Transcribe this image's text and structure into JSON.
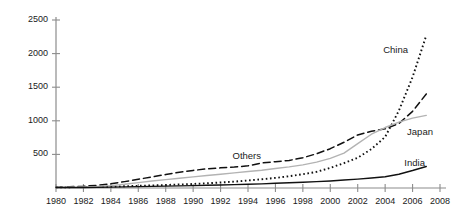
{
  "chart_data": {
    "type": "line",
    "title": "",
    "xlabel": "",
    "ylabel": "",
    "xlim": [
      1980,
      2008
    ],
    "ylim": [
      0,
      2500
    ],
    "grid": false,
    "legend_position": "inline-at-line-end",
    "x_ticks": [
      "1980",
      "1982",
      "1984",
      "1986",
      "1988",
      "1990",
      "1992",
      "1994",
      "1996",
      "1998",
      "2000",
      "2002",
      "2004",
      "2006",
      "2008"
    ],
    "y_ticks": [
      "500",
      "1000",
      "1500",
      "2000",
      "2500"
    ],
    "x": [
      1980,
      1981,
      1982,
      1983,
      1984,
      1985,
      1986,
      1987,
      1988,
      1989,
      1990,
      1991,
      1992,
      1993,
      1994,
      1995,
      1996,
      1997,
      1998,
      1999,
      2000,
      2001,
      2002,
      2003,
      2004,
      2005,
      2006,
      2007
    ],
    "series": [
      {
        "name": "China",
        "label": "China",
        "style": "dotted",
        "color": "#111111",
        "end_value": 2270,
        "values": [
          10,
          12,
          14,
          16,
          20,
          26,
          32,
          38,
          45,
          52,
          60,
          70,
          82,
          95,
          112,
          130,
          150,
          175,
          205,
          240,
          300,
          370,
          450,
          580,
          760,
          1150,
          1650,
          2270
        ]
      },
      {
        "name": "Others",
        "label": "Others",
        "style": "dashed",
        "color": "#111111",
        "end_value": 1400,
        "values": [
          12,
          18,
          26,
          40,
          62,
          95,
          130,
          165,
          200,
          235,
          262,
          285,
          300,
          312,
          330,
          372,
          392,
          410,
          450,
          510,
          585,
          680,
          790,
          845,
          880,
          960,
          1140,
          1400
        ]
      },
      {
        "name": "Japan",
        "label": "Japan",
        "style": "solid",
        "color": "#b3b3b3",
        "end_value": 1080,
        "values": [
          8,
          11,
          15,
          22,
          35,
          55,
          80,
          105,
          125,
          145,
          165,
          185,
          205,
          225,
          245,
          265,
          290,
          315,
          345,
          385,
          440,
          520,
          660,
          800,
          900,
          980,
          1040,
          1080
        ]
      },
      {
        "name": "India",
        "label": "India",
        "style": "solid",
        "color": "#111111",
        "end_value": 320,
        "values": [
          5,
          6,
          8,
          10,
          13,
          16,
          20,
          24,
          28,
          32,
          36,
          40,
          45,
          50,
          56,
          62,
          70,
          78,
          86,
          95,
          105,
          118,
          132,
          148,
          168,
          205,
          260,
          320
        ]
      }
    ]
  },
  "labels": {
    "china": "China",
    "others": "Others",
    "japan": "Japan",
    "india": "India"
  }
}
